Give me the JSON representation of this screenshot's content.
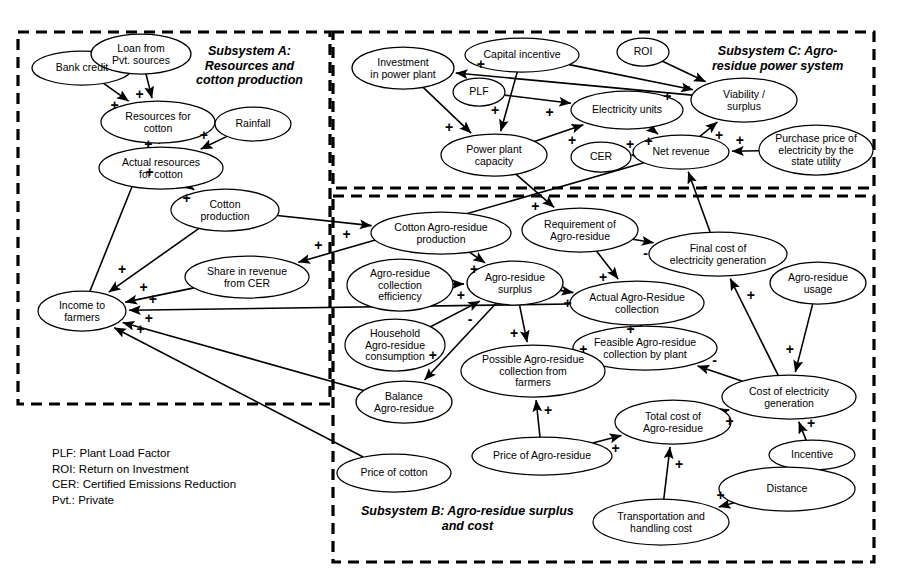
{
  "figure": {
    "kind": "causal-loop-diagram",
    "width": 905,
    "height": 582,
    "background": "#ffffff",
    "stroke": "#000000"
  },
  "subsystems": [
    {
      "id": "A",
      "title": "Subsystem A:\nResources and\ncotton production",
      "box": {
        "x": 18,
        "y": 32,
        "w": 312,
        "h": 372
      },
      "title_pos": {
        "x": 196,
        "y": 44
      }
    },
    {
      "id": "C",
      "title": "Subsystem C: Agro-\nresidue power system",
      "box": {
        "x": 333,
        "y": 32,
        "w": 541,
        "h": 156
      },
      "title_pos": {
        "x": 712,
        "y": 44
      }
    },
    {
      "id": "B",
      "title": "Subsystem B: Agro-residue surplus\nand cost",
      "box": {
        "x": 333,
        "y": 196,
        "w": 541,
        "h": 366
      },
      "title_pos": {
        "x": 361,
        "y": 504
      }
    }
  ],
  "nodes": [
    {
      "id": "bank_credit",
      "label": "Bank credit",
      "cx": 82,
      "cy": 68,
      "rx": 50,
      "ry": 17,
      "subsystem": "A"
    },
    {
      "id": "loan_pvt",
      "label": "Loan from\nPvt. sources",
      "cx": 141,
      "cy": 54,
      "rx": 50,
      "ry": 20,
      "subsystem": "A"
    },
    {
      "id": "resources_cotton",
      "label": "Resources for\ncotton",
      "cx": 158,
      "cy": 122,
      "rx": 57,
      "ry": 21,
      "subsystem": "A"
    },
    {
      "id": "rainfall",
      "label": "Rainfall",
      "cx": 253,
      "cy": 124,
      "rx": 38,
      "ry": 17,
      "subsystem": "A"
    },
    {
      "id": "actual_resources_cotton",
      "label": "Actual resources\nfor cotton",
      "cx": 161,
      "cy": 168,
      "rx": 62,
      "ry": 21,
      "subsystem": "A"
    },
    {
      "id": "cotton_production",
      "label": "Cotton\nproduction",
      "cx": 225,
      "cy": 210,
      "rx": 54,
      "ry": 21,
      "subsystem": "A"
    },
    {
      "id": "share_revenue_cer",
      "label": "Share in revenue\nfrom CER",
      "cx": 247,
      "cy": 277,
      "rx": 62,
      "ry": 21,
      "subsystem": "A"
    },
    {
      "id": "income_farmers",
      "label": "Income to\nfarmers",
      "cx": 82,
      "cy": 311,
      "rx": 44,
      "ry": 20,
      "subsystem": "A"
    },
    {
      "id": "price_cotton",
      "label": "Price of cotton",
      "cx": 394,
      "cy": 473,
      "rx": 57,
      "ry": 19,
      "subsystem": "B"
    },
    {
      "id": "investment_power_plant",
      "label": "Investment\nin power plant",
      "cx": 403,
      "cy": 68,
      "rx": 51,
      "ry": 21,
      "subsystem": "C"
    },
    {
      "id": "capital_incentive",
      "label": "Capital incentive",
      "cx": 522,
      "cy": 55,
      "rx": 57,
      "ry": 17,
      "subsystem": "C"
    },
    {
      "id": "roi",
      "label": "ROI",
      "cx": 643,
      "cy": 52,
      "rx": 26,
      "ry": 14,
      "subsystem": "C"
    },
    {
      "id": "plf",
      "label": "PLF",
      "cx": 479,
      "cy": 92,
      "rx": 26,
      "ry": 14,
      "subsystem": "C"
    },
    {
      "id": "electricity_units",
      "label": "Electricity units",
      "cx": 627,
      "cy": 110,
      "rx": 56,
      "ry": 19,
      "subsystem": "C"
    },
    {
      "id": "viability_surplus",
      "label": "Viability /\nsurplus",
      "cx": 744,
      "cy": 100,
      "rx": 53,
      "ry": 22,
      "subsystem": "C"
    },
    {
      "id": "power_plant_capacity",
      "label": "Power plant\ncapacity",
      "cx": 494,
      "cy": 155,
      "rx": 53,
      "ry": 21,
      "subsystem": "C"
    },
    {
      "id": "cer",
      "label": "CER",
      "cx": 601,
      "cy": 157,
      "rx": 30,
      "ry": 15,
      "subsystem": "C"
    },
    {
      "id": "net_revenue",
      "label": "Net revenue",
      "cx": 681,
      "cy": 152,
      "rx": 48,
      "ry": 17,
      "subsystem": "C"
    },
    {
      "id": "purchase_price_electricity",
      "label": "Purchase price of\nelectricity by the\nstate utility",
      "cx": 816,
      "cy": 150,
      "rx": 57,
      "ry": 25,
      "subsystem": "C"
    },
    {
      "id": "cotton_agro_residue_production",
      "label": "Cotton Agro-residue\nproduction",
      "cx": 441,
      "cy": 233,
      "rx": 70,
      "ry": 21,
      "subsystem": "B"
    },
    {
      "id": "requirement_agro_residue",
      "label": "Requirement of\nAgro-residue",
      "cx": 580,
      "cy": 230,
      "rx": 58,
      "ry": 22,
      "subsystem": "B"
    },
    {
      "id": "final_cost_electricity",
      "label": "Final cost of\nelectricity generation",
      "cx": 718,
      "cy": 254,
      "rx": 69,
      "ry": 22,
      "subsystem": "B"
    },
    {
      "id": "agro_residue_collection_efficiency",
      "label": "Agro-residue\ncollection\nefficiency",
      "cx": 400,
      "cy": 285,
      "rx": 53,
      "ry": 26,
      "subsystem": "B"
    },
    {
      "id": "agro_residue_surplus",
      "label": "Agro-residue\nsurplus",
      "cx": 515,
      "cy": 283,
      "rx": 48,
      "ry": 22,
      "subsystem": "B"
    },
    {
      "id": "agro_residue_usage",
      "label": "Agro-residue\nusage",
      "cx": 818,
      "cy": 283,
      "rx": 48,
      "ry": 21,
      "subsystem": "B"
    },
    {
      "id": "actual_agro_residue_collection",
      "label": "Actual Agro-Residue\ncollection",
      "cx": 637,
      "cy": 303,
      "rx": 67,
      "ry": 22,
      "subsystem": "B"
    },
    {
      "id": "household_agro_residue_consumption",
      "label": "Household\nAgro-residue\nconsumption",
      "cx": 395,
      "cy": 345,
      "rx": 50,
      "ry": 26,
      "subsystem": "B"
    },
    {
      "id": "feasible_agro_residue_collection",
      "label": "Feasible Agro-residue\ncollection by plant",
      "cx": 645,
      "cy": 348,
      "rx": 72,
      "ry": 22,
      "subsystem": "B"
    },
    {
      "id": "possible_agro_residue_collection",
      "label": "Possible Agro-residue\ncollection from\nfarmers",
      "cx": 533,
      "cy": 371,
      "rx": 72,
      "ry": 26,
      "subsystem": "B"
    },
    {
      "id": "cost_electricity_generation",
      "label": "Cost of electricity\ngeneration",
      "cx": 789,
      "cy": 397,
      "rx": 67,
      "ry": 22,
      "subsystem": "B"
    },
    {
      "id": "balance_agro_residue",
      "label": "Balance\nAgro-residue",
      "cx": 404,
      "cy": 402,
      "rx": 48,
      "ry": 21,
      "subsystem": "B"
    },
    {
      "id": "total_cost_agro_residue",
      "label": "Total cost of\nAgro-residue",
      "cx": 673,
      "cy": 422,
      "rx": 58,
      "ry": 22,
      "subsystem": "B"
    },
    {
      "id": "incentive",
      "label": "Incentive",
      "cx": 812,
      "cy": 455,
      "rx": 43,
      "ry": 15,
      "subsystem": "B"
    },
    {
      "id": "price_agro_residue",
      "label": "Price of Agro-residue",
      "cx": 542,
      "cy": 456,
      "rx": 70,
      "ry": 19,
      "subsystem": "B"
    },
    {
      "id": "distance",
      "label": "Distance",
      "cx": 787,
      "cy": 489,
      "rx": 68,
      "ry": 22,
      "subsystem": "B"
    },
    {
      "id": "transportation_handling_cost",
      "label": "Transportation and\nhandling cost",
      "cx": 661,
      "cy": 522,
      "rx": 68,
      "ry": 23,
      "subsystem": "B"
    }
  ],
  "edges": [
    {
      "from": "bank_credit",
      "to": "loan_pvt",
      "sign": ""
    },
    {
      "from": "bank_credit",
      "to": "resources_cotton",
      "sign": "+"
    },
    {
      "from": "loan_pvt",
      "to": "resources_cotton",
      "sign": "+"
    },
    {
      "from": "resources_cotton",
      "to": "actual_resources_cotton",
      "sign": "+"
    },
    {
      "from": "rainfall",
      "to": "actual_resources_cotton",
      "sign": "+"
    },
    {
      "from": "actual_resources_cotton",
      "to": "cotton_production",
      "sign": "+"
    },
    {
      "from": "cotton_production",
      "to": "income_farmers",
      "sign": "+"
    },
    {
      "from": "income_farmers",
      "to": "resources_cotton",
      "sign": "+"
    },
    {
      "from": "share_revenue_cer",
      "to": "income_farmers",
      "sign": "+"
    },
    {
      "from": "cotton_production",
      "to": "cotton_agro_residue_production",
      "sign": "+"
    },
    {
      "from": "price_cotton",
      "to": "income_farmers",
      "sign": "+"
    },
    {
      "from": "investment_power_plant",
      "to": "power_plant_capacity",
      "sign": "+"
    },
    {
      "from": "capital_incentive",
      "to": "power_plant_capacity",
      "sign": "+"
    },
    {
      "from": "capital_incentive",
      "to": "viability_surplus",
      "sign": "+"
    },
    {
      "from": "roi",
      "to": "viability_surplus",
      "sign": "-"
    },
    {
      "from": "plf",
      "to": "electricity_units",
      "sign": "+"
    },
    {
      "from": "power_plant_capacity",
      "to": "electricity_units",
      "sign": "+"
    },
    {
      "from": "electricity_units",
      "to": "net_revenue",
      "sign": "+"
    },
    {
      "from": "cer",
      "to": "net_revenue",
      "sign": "+"
    },
    {
      "from": "net_revenue",
      "to": "viability_surplus",
      "sign": "+"
    },
    {
      "from": "purchase_price_electricity",
      "to": "net_revenue",
      "sign": "+"
    },
    {
      "from": "final_cost_electricity",
      "to": "net_revenue",
      "sign": "-"
    },
    {
      "from": "viability_surplus",
      "to": "investment_power_plant",
      "sign": "+"
    },
    {
      "from": "power_plant_capacity",
      "to": "requirement_agro_residue",
      "sign": "+"
    },
    {
      "from": "cotton_agro_residue_production",
      "to": "agro_residue_surplus",
      "sign": "+"
    },
    {
      "from": "agro_residue_collection_efficiency",
      "to": "agro_residue_surplus",
      "sign": "+"
    },
    {
      "from": "requirement_agro_residue",
      "to": "actual_agro_residue_collection",
      "sign": "+"
    },
    {
      "from": "requirement_agro_residue",
      "to": "final_cost_electricity",
      "sign": "-"
    },
    {
      "from": "agro_residue_surplus",
      "to": "actual_agro_residue_collection",
      "sign": "+"
    },
    {
      "from": "agro_residue_surplus",
      "to": "possible_agro_residue_collection",
      "sign": "+"
    },
    {
      "from": "agro_residue_surplus",
      "to": "balance_agro_residue",
      "sign": "+"
    },
    {
      "from": "household_agro_residue_consumption",
      "to": "agro_residue_surplus",
      "sign": "-"
    },
    {
      "from": "possible_agro_residue_collection",
      "to": "feasible_agro_residue_collection",
      "sign": "+"
    },
    {
      "from": "feasible_agro_residue_collection",
      "to": "actual_agro_residue_collection",
      "sign": "+"
    },
    {
      "from": "cost_electricity_generation",
      "to": "feasible_agro_residue_collection",
      "sign": "-"
    },
    {
      "from": "cost_electricity_generation",
      "to": "final_cost_electricity",
      "sign": "+"
    },
    {
      "from": "agro_residue_usage",
      "to": "cost_electricity_generation",
      "sign": "+"
    },
    {
      "from": "price_agro_residue",
      "to": "possible_agro_residue_collection",
      "sign": "+"
    },
    {
      "from": "price_agro_residue",
      "to": "total_cost_agro_residue",
      "sign": "+"
    },
    {
      "from": "transportation_handling_cost",
      "to": "total_cost_agro_residue",
      "sign": "+"
    },
    {
      "from": "total_cost_agro_residue",
      "to": "cost_electricity_generation",
      "sign": "+"
    },
    {
      "from": "incentive",
      "to": "cost_electricity_generation",
      "sign": "+"
    },
    {
      "from": "distance",
      "to": "transportation_handling_cost",
      "sign": "+"
    },
    {
      "from": "balance_agro_residue",
      "to": "income_farmers",
      "sign": "+"
    },
    {
      "from": "actual_agro_residue_collection",
      "to": "income_farmers",
      "sign": "+"
    },
    {
      "from": "net_revenue",
      "to": "share_revenue_cer",
      "sign": "+"
    }
  ],
  "legend": {
    "lines": "PLF: Plant Load Factor\nROI: Return on Investment\nCER: Certified Emissions Reduction\nPvt.: Private"
  }
}
